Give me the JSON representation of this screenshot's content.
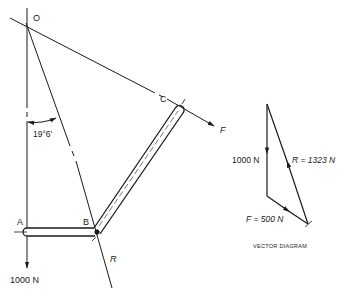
{
  "diagram": {
    "space_diagram": {
      "points": {
        "O": "O",
        "A": "A",
        "B": "B",
        "C": "C"
      },
      "angle_label": "19°6′",
      "load_label": "1000 N",
      "force_F_label": "F",
      "reaction_R_label": "R"
    },
    "vector_diagram": {
      "title": "VECTOR DIAGRAM",
      "load_label": "1000 N",
      "R_label": "R = 1323 N",
      "F_label": "F = 500 N",
      "values": {
        "load_N": 1000,
        "R_N": 1323,
        "F_N": 500
      }
    },
    "colors": {
      "ink": "#1a1a1a",
      "background": "#ffffff"
    }
  }
}
